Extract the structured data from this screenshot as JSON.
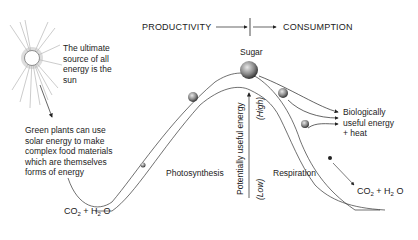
{
  "header": {
    "productivity": "PRODUCTIVITY",
    "consumption": "CONSUMPTION"
  },
  "labels": {
    "sun_note": [
      "The ultimate",
      "source of all",
      "energy is the",
      "sun"
    ],
    "plants_note": [
      "Green plants can use",
      "solar energy to make",
      "complex food materials",
      "which are themselves",
      "forms of energy"
    ],
    "sugar": "Sugar",
    "photosynthesis": "Photosynthesis",
    "respiration": "Respiration",
    "bio_energy": [
      "Biologically",
      "useful energy",
      "+ heat"
    ],
    "axis_label": "Potentially useful energy",
    "axis_high": "(High)",
    "axis_low": "(Low)",
    "reactants_left": {
      "co": "CO",
      "sub1": "2",
      "plus_h": " + H",
      "sub2": "2",
      "o": " O"
    },
    "products_right": {
      "co": "CO",
      "sub1": "2",
      "plus_h": " + H",
      "sub2": "2",
      "o": " O"
    }
  },
  "icons": [
    "sun-icon",
    "sugar-molecule-icon",
    "arrow-icon"
  ]
}
